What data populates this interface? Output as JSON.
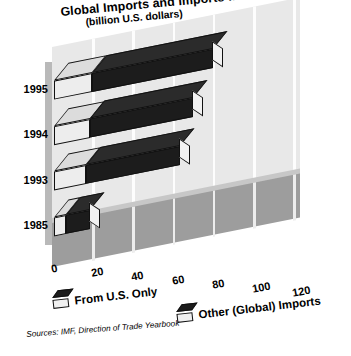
{
  "chart_data": {
    "type": "bar",
    "orientation": "horizontal",
    "stacked": true,
    "style": "3d-isometric",
    "title": "Global Imports and Imports from the U.S.",
    "subtitle": "(billion U.S. dollars)",
    "xlabel": "",
    "ylabel": "",
    "categories": [
      "1985",
      "1993",
      "1994",
      "1995"
    ],
    "xticks": [
      "0",
      "20",
      "40",
      "60",
      "80",
      "100",
      "120"
    ],
    "xlim": [
      0,
      120
    ],
    "grid": true,
    "legend_position": "bottom",
    "series": [
      {
        "name": "From U.S. Only",
        "color": "#ededed",
        "values": [
          6,
          16,
          18,
          19
        ]
      },
      {
        "name": "Other (Global) Imports",
        "color": "#1c1c1c",
        "values": [
          12,
          47,
          51,
          60
        ]
      }
    ],
    "totals": [
      18,
      63,
      69,
      79
    ],
    "source": "Sources: IMF, Direction of Trade Yearbook"
  },
  "title": {
    "main": "Global Imports and Imports from the U.S.",
    "sub": "(billion U.S. dollars)"
  },
  "axis": {
    "y_categories": [
      "1995",
      "1994",
      "1993",
      "1985"
    ],
    "x_ticks": [
      "0",
      "20",
      "40",
      "60",
      "80",
      "100",
      "120"
    ]
  },
  "legend": {
    "items": [
      {
        "label": "From U.S. Only"
      },
      {
        "label": "Other (Global) Imports"
      }
    ]
  },
  "footer": {
    "source": "Sources: IMF, Direction of Trade Yearbook"
  }
}
